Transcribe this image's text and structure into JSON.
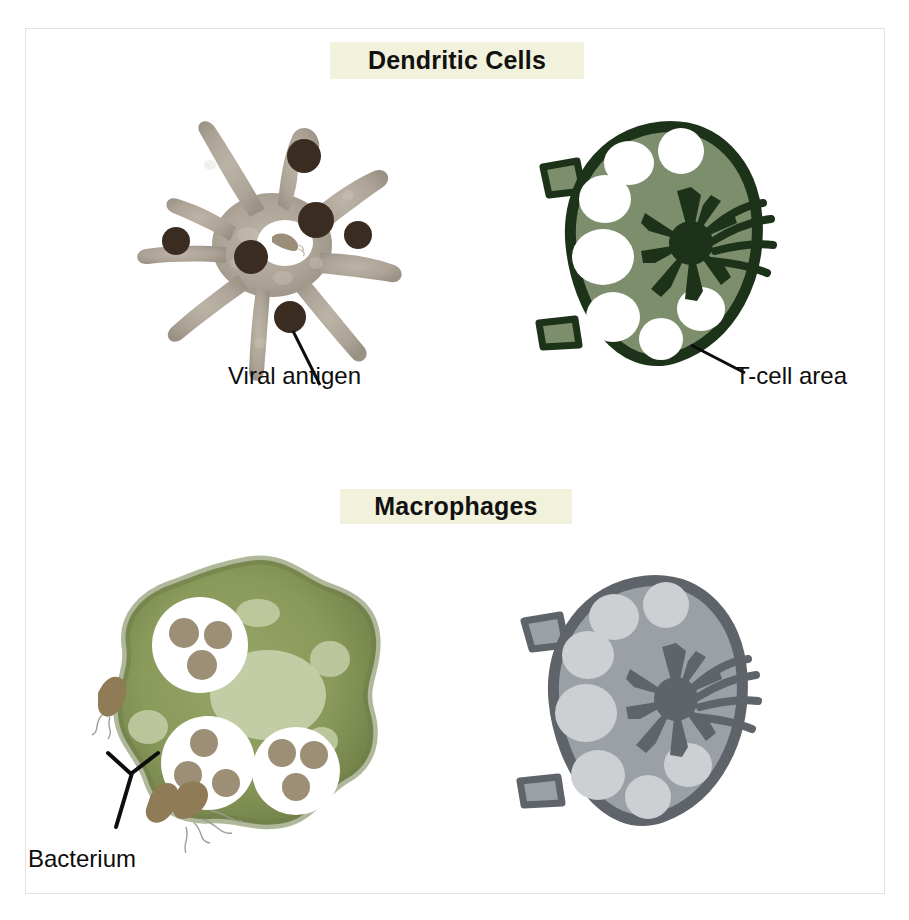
{
  "figure": {
    "background_color": "#ffffff",
    "frame_color": "#e2e2e2"
  },
  "sections": [
    {
      "id": "dendritic",
      "banner_label": "Dendritic Cells",
      "banner_bg": "#f1f1dc",
      "banner_text_color": "#111111"
    },
    {
      "id": "macrophages",
      "banner_label": "Macrophages",
      "banner_bg": "#f1f1dc",
      "banner_text_color": "#111111"
    }
  ],
  "callouts": [
    {
      "id": "viral-antigen",
      "label": "Viral antigen",
      "leader": "single-line",
      "color": "#0d0d0d"
    },
    {
      "id": "t-cell-area",
      "label": "T-cell area",
      "leader": "single-line",
      "color": "#0d0d0d"
    },
    {
      "id": "bacterium",
      "label": "Bacterium",
      "leader": "forked-y",
      "color": "#0d0d0d"
    }
  ],
  "illustrations": {
    "dendritic_cell": {
      "name": "dendritic cell",
      "body_fill": "#a9a095",
      "body_fill_light": "#bcb3a7",
      "dendrite_count": 8,
      "antigen_dots": 6,
      "antigen_color": "#3b2c22",
      "phagosome_fill": "#ffffff",
      "engulfed_bacterium_color": "#9b8e78"
    },
    "lymph_node_green": {
      "name": "lymph node with T-cell area",
      "outline_color": "#1d3319",
      "body_fill": "#7d8e6d",
      "follicle_fill": "#ffffff",
      "follicle_count": 8,
      "hilum_color": "#1d3319",
      "vessel_stub_count": 4
    },
    "macrophage": {
      "name": "macrophage",
      "body_fill": "#8a9a5b",
      "body_edge": "#6f7d48",
      "nucleus_fill": "#c9d3ae",
      "phagosome_fill": "#ffffff",
      "phagosome_count": 3,
      "bacteria_per_phagosome": 3,
      "bacteria_color": "#9d8f76",
      "vacuole_fill": "#c9d3ae"
    },
    "lymph_node_gray": {
      "name": "lymph node (gray)",
      "outline_color": "#5f646a",
      "body_fill": "#9aa0a6",
      "follicle_fill": "#ccd0d2",
      "follicle_count": 8,
      "hilum_color": "#5f646a",
      "vessel_stub_count": 4
    },
    "free_bacteria": {
      "name": "bacteria with flagella",
      "count": 2,
      "body_color": "#8f7b55",
      "flagella_color": "#8d8d85"
    }
  }
}
